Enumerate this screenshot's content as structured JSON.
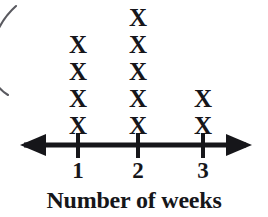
{
  "chart_data": {
    "type": "bar",
    "plot_style": "dot-plot-x",
    "title": "",
    "xlabel": "Number of weeks",
    "ylabel": "",
    "categories": [
      "1",
      "2",
      "3"
    ],
    "values": [
      4,
      5,
      2
    ],
    "tick_labels": [
      "1",
      "2",
      "3"
    ],
    "mark_glyph": "X",
    "axis": {
      "orientation": "horizontal",
      "arrow_left": true,
      "arrow_right": true,
      "grid": false,
      "ticks_shown": [
        "1",
        "2",
        "3"
      ]
    },
    "legend": null,
    "annotations": []
  },
  "figure": {
    "axis_title": "Number of weeks",
    "mark": "X",
    "ink_color": "#16161a",
    "background_color": "#ffffff",
    "artifact_color": "#5a5a60",
    "columns": [
      {
        "label": "1",
        "count": 4,
        "center_x": 78,
        "marks": [
          "X",
          "X",
          "X",
          "X"
        ]
      },
      {
        "label": "2",
        "count": 5,
        "center_x": 138,
        "marks": [
          "X",
          "X",
          "X",
          "X",
          "X"
        ]
      },
      {
        "label": "3",
        "count": 2,
        "center_x": 203,
        "marks": [
          "X",
          "X"
        ]
      }
    ]
  }
}
